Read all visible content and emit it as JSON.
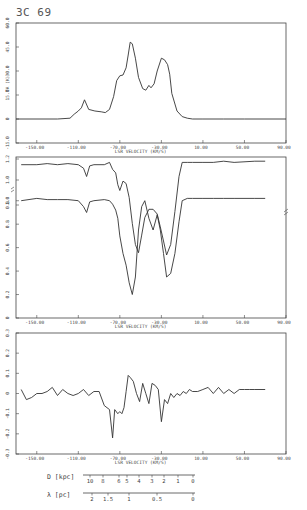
{
  "figure_title": "3C 69",
  "chart_data": [
    {
      "type": "line",
      "panel": "emission",
      "title": "3C 69",
      "xlabel": "LSR VELOCITY (KM/S)",
      "ylabel": "TA (K)",
      "xlim": [
        -170,
        90
      ],
      "ylim": [
        -15,
        60
      ],
      "x_ticks": [
        "-150.00",
        "-110.00",
        "-70.00",
        "-30.00",
        "10.00",
        "50.00",
        "90.00"
      ],
      "y_ticks": [
        "-15.0",
        "0",
        "15.0",
        "30.0",
        "45.0",
        "60.0"
      ],
      "grid": false,
      "series": [
        {
          "name": "emission",
          "x": [
            -170,
            -130,
            -118,
            -114,
            -110,
            -107,
            -104,
            -100,
            -94,
            -88,
            -84,
            -80,
            -76,
            -73,
            -70,
            -67,
            -64,
            -62,
            -60,
            -58,
            -55,
            -52,
            -48,
            -45,
            -42,
            -40,
            -37,
            -34,
            -30,
            -27,
            -24,
            -22,
            -20,
            -15,
            -10,
            -5,
            0,
            10,
            30,
            50,
            90
          ],
          "values": [
            0,
            0,
            0.5,
            3,
            5,
            7,
            12,
            6,
            5,
            4.5,
            4,
            6,
            14,
            24,
            27,
            27.5,
            32,
            40,
            48,
            47,
            38,
            26,
            19,
            18,
            21,
            19.5,
            22,
            30,
            38,
            37,
            34,
            28,
            16,
            5,
            1.5,
            0.5,
            0,
            0,
            0,
            0,
            0
          ]
        }
      ]
    },
    {
      "type": "line",
      "panel": "absorption",
      "xlabel": "LSR VELOCITY (KM/S)",
      "ylabel": "",
      "xlim": [
        -170,
        90
      ],
      "ylim": [
        0,
        1.2
      ],
      "x_ticks": [
        "-150.00",
        "-110.00",
        "-70.00",
        "-30.00",
        "10.00",
        "50.00",
        "90.00"
      ],
      "y_ticks_lower": [
        "0",
        "0.2",
        "0.4",
        "0.6",
        "0.8",
        "1.0"
      ],
      "y_ticks_upper": [
        "0.8",
        "1.0",
        "1.2"
      ],
      "axis_break": true,
      "grid": false,
      "series": [
        {
          "name": "upper (offset) spectrum",
          "x": [
            -165,
            -150,
            -140,
            -130,
            -120,
            -110,
            -105,
            -102,
            -99,
            -95,
            -85,
            -80,
            -77,
            -74,
            -72,
            -70,
            -67,
            -64,
            -61,
            -58,
            -55,
            -52,
            -49,
            -46,
            -42,
            -38,
            -34,
            -31,
            -28,
            -25,
            -21,
            -17,
            -13,
            -10,
            -5,
            0,
            10,
            20,
            30,
            40,
            60,
            70
          ],
          "values": [
            1.0,
            1.0,
            1.01,
            1.0,
            1.01,
            1.0,
            0.97,
            0.9,
            0.99,
            1.0,
            1.0,
            1.02,
            0.96,
            0.93,
            0.83,
            0.78,
            0.86,
            0.84,
            0.72,
            0.5,
            0.32,
            0.25,
            0.4,
            0.55,
            0.62,
            0.62,
            0.58,
            0.47,
            0.35,
            0.23,
            0.32,
            0.6,
            0.9,
            1.02,
            1.02,
            1.02,
            1.02,
            1.02,
            1.03,
            1.02,
            1.03,
            1.03
          ]
        },
        {
          "name": "lower spectrum",
          "x": [
            -165,
            -150,
            -140,
            -130,
            -120,
            -110,
            -105,
            -102,
            -99,
            -95,
            -85,
            -80,
            -77,
            -74,
            -72,
            -70,
            -67,
            -64,
            -61,
            -58,
            -55,
            -52,
            -49,
            -46,
            -42,
            -38,
            -34,
            -31,
            -28,
            -25,
            -21,
            -17,
            -13,
            -10,
            -5,
            0,
            10,
            20,
            30,
            40,
            60,
            70
          ],
          "values": [
            1.0,
            1.02,
            1.01,
            1.01,
            1.01,
            1.0,
            0.95,
            0.9,
            0.99,
            1.0,
            1.01,
            1.0,
            0.97,
            0.92,
            0.85,
            0.7,
            0.55,
            0.45,
            0.3,
            0.2,
            0.35,
            0.75,
            0.95,
            1.0,
            0.85,
            0.75,
            0.88,
            0.75,
            0.55,
            0.35,
            0.38,
            0.55,
            0.82,
            1.0,
            1.02,
            1.02,
            1.02,
            1.02,
            1.02,
            1.02,
            1.02,
            1.02
          ]
        }
      ]
    },
    {
      "type": "line",
      "panel": "difference",
      "xlabel": "LSR VELOCITY (KM/S)",
      "ylabel": "",
      "xlim": [
        -170,
        90
      ],
      "ylim": [
        -0.3,
        0.3
      ],
      "x_ticks": [
        "-150.00",
        "-110.00",
        "-70.00",
        "-30.00",
        "10.00",
        "50.00",
        "90.00"
      ],
      "y_ticks": [
        "-0.3",
        "-0.2",
        "-0.1",
        "0",
        "0.1",
        "0.2",
        "0.3"
      ],
      "grid": false,
      "series": [
        {
          "name": "difference",
          "x": [
            -165,
            -160,
            -155,
            -150,
            -145,
            -140,
            -135,
            -130,
            -125,
            -120,
            -115,
            -110,
            -105,
            -100,
            -95,
            -90,
            -85,
            -80,
            -77,
            -75,
            -72,
            -70,
            -68,
            -66,
            -64,
            -62,
            -60,
            -57,
            -54,
            -51,
            -48,
            -45,
            -42,
            -39,
            -36,
            -33,
            -30,
            -27,
            -24,
            -21,
            -18,
            -15,
            -12,
            -9,
            -6,
            -3,
            0,
            5,
            10,
            15,
            20,
            25,
            30,
            35,
            40,
            45,
            50,
            55,
            60,
            70
          ],
          "values": [
            0.02,
            -0.03,
            -0.02,
            0.0,
            0.0,
            0.01,
            0.03,
            -0.01,
            0.02,
            0.0,
            -0.01,
            0.0,
            0.02,
            -0.01,
            0.01,
            0.01,
            -0.06,
            -0.08,
            -0.22,
            -0.08,
            -0.1,
            -0.09,
            -0.1,
            -0.07,
            0.01,
            0.09,
            0.08,
            0.06,
            0.0,
            -0.04,
            0.05,
            0.0,
            -0.05,
            0.05,
            0.04,
            0.02,
            -0.14,
            -0.03,
            -0.05,
            0.0,
            -0.02,
            0.0,
            -0.01,
            0.01,
            0.0,
            0.02,
            0.01,
            0.01,
            0.02,
            0.03,
            0.0,
            0.03,
            0.0,
            0.02,
            0.0,
            0.02,
            0.02,
            0.02,
            0.02,
            0.02
          ]
        }
      ]
    }
  ],
  "distance_scale": {
    "label": "D [kpc]",
    "ticks": [
      "10",
      "8",
      "6",
      "5",
      "4",
      "3",
      "2",
      "1",
      "0"
    ],
    "tick_x": [
      90,
      103,
      119,
      127,
      139,
      152,
      164,
      178,
      193
    ]
  },
  "lambda_scale": {
    "label": "λ [pc]",
    "ticks": [
      "2",
      "1.5",
      "1",
      "0.5",
      "0"
    ],
    "tick_x": [
      92,
      108,
      129,
      157,
      193
    ]
  }
}
